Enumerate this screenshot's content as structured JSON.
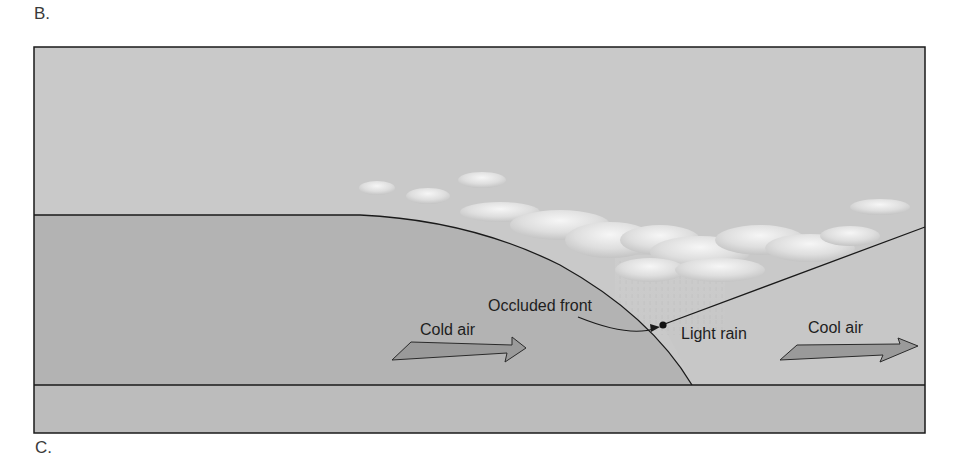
{
  "panels": {
    "top_label": "B.",
    "bottom_label": "C."
  },
  "diagram": {
    "labels": {
      "occluded_front": "Occluded front",
      "cold_air": "Cold air",
      "light_rain": "Light rain",
      "cool_air": "Cool air"
    },
    "colors": {
      "sky": "#c9c9c9",
      "cold_air_mass": "#b3b3b3",
      "cool_air_mass": "#c6c6c6",
      "ground": "#bcbcbc",
      "line": "#1a1a1a",
      "arrow_fill": "#9a9a9a",
      "cloud": "#ececec"
    }
  }
}
